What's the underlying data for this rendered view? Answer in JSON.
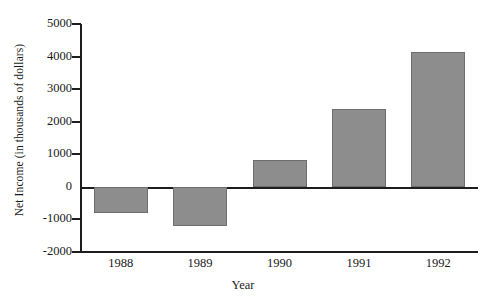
{
  "chart_data": {
    "type": "bar",
    "title": "",
    "subtitle": "",
    "xlabel": "Year",
    "ylabel": "Net Income (in thousands of dollars)",
    "categories": [
      "1988",
      "1989",
      "1990",
      "1991",
      "1992"
    ],
    "values": [
      -800,
      -1200,
      830,
      2400,
      4140
    ],
    "series": [
      {
        "name": "Net Income",
        "values": [
          -800,
          -1200,
          830,
          2400,
          4140
        ]
      }
    ],
    "ylim": [
      -2000,
      5000
    ],
    "ytick_labels": [
      "5000",
      "4000",
      "3000",
      "2000",
      "1000",
      "0",
      "-1000",
      "-2000"
    ],
    "ytick_values": [
      5000,
      4000,
      3000,
      2000,
      1000,
      0,
      -1000,
      -2000
    ],
    "grid": false,
    "legend": false,
    "legend_position": "none",
    "bar_color": "#8d8d8d",
    "bar_edge_color": "#6e6e6e",
    "axis_color": "#1d1d1d",
    "background_color": "#ffffff"
  }
}
